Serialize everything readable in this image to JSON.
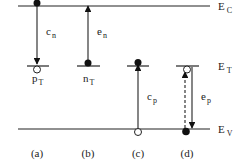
{
  "diagram": {
    "levels": {
      "conduction": {
        "label": "E",
        "sub": "C"
      },
      "trap": {
        "label": "E",
        "sub": "T"
      },
      "valence": {
        "label": "E",
        "sub": "V"
      }
    },
    "panels": [
      {
        "id": "a",
        "label": "(a)",
        "rate": {
          "main": "c",
          "sub": "n"
        },
        "trap_state": {
          "main": "p",
          "sub": "T"
        },
        "process": "electron capture"
      },
      {
        "id": "b",
        "label": "(b)",
        "rate": {
          "main": "e",
          "sub": "n"
        },
        "trap_state": {
          "main": "n",
          "sub": "T"
        },
        "process": "electron emission"
      },
      {
        "id": "c",
        "label": "(c)",
        "rate": {
          "main": "c",
          "sub": "p"
        },
        "process": "hole capture"
      },
      {
        "id": "d",
        "label": "(d)",
        "rate": {
          "main": "e",
          "sub": "p"
        },
        "process": "hole emission"
      }
    ],
    "colors": {
      "line": "#222222",
      "filled": "#111111",
      "hollow": "#ffffff"
    }
  }
}
